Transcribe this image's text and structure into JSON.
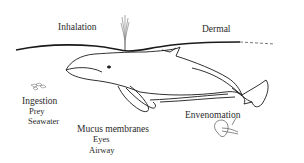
{
  "diagram": {
    "type": "whale exposure routes illustration",
    "labels": {
      "inhalation": "Inhalation",
      "dermal": "Dermal",
      "ingestion": "Ingestion",
      "ingestion_items": [
        "Prey",
        "Seawater"
      ],
      "mucus": "Mucus membranes",
      "mucus_items": [
        "Eyes",
        "Airway"
      ],
      "envenomation": "Envenomation"
    },
    "elements": {
      "water_surface": "water-surface-line",
      "whale": "whale-drawing",
      "blow": "spout-plume",
      "prey": "small-fish-school",
      "jellyfish": "jellyfish-drawing"
    },
    "colors": {
      "line": "#1a1a1a",
      "text": "#2a2a2a",
      "background": "#ffffff"
    }
  }
}
